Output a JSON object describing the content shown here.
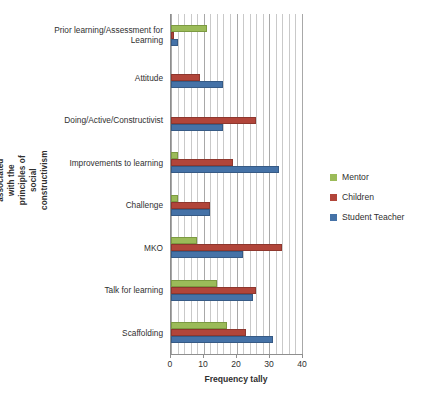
{
  "chart_data": {
    "type": "bar",
    "orientation": "horizontal",
    "title": "",
    "xlabel": "Frequency tally",
    "ylabel": "Themes most associated with the principles of social constructivism",
    "xlim": [
      0,
      40
    ],
    "xticks": [
      0,
      10,
      20,
      30,
      40
    ],
    "xtick_labels": [
      "0",
      "10",
      "20",
      "30",
      "40"
    ],
    "minor_gridlines": true,
    "minor_tick_step": 2,
    "grid": true,
    "legend_position": "right",
    "categories": [
      "Prior learning/Assessment for Learning",
      "Attitude",
      "Doing/Active/Constructivist",
      "Improvements to learning",
      "Challenge",
      "MKO",
      "Talk for learning",
      "Scaffolding"
    ],
    "series": [
      {
        "name": "Mentor",
        "color": "#9bbb59",
        "values": [
          11,
          0,
          0,
          2,
          2,
          8,
          14,
          17
        ]
      },
      {
        "name": "Children",
        "color": "#b1453a",
        "values": [
          1,
          9,
          26,
          19,
          12,
          34,
          26,
          23
        ]
      },
      {
        "name": "Student Teacher",
        "color": "#4572a7",
        "values": [
          2,
          16,
          16,
          33,
          12,
          22,
          25,
          31
        ]
      }
    ]
  }
}
